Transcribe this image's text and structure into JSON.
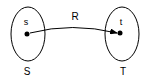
{
  "diagram": {
    "sets": [
      {
        "name": "S",
        "element": "s"
      },
      {
        "name": "T",
        "element": "t"
      }
    ],
    "relation": {
      "label": "R",
      "from": "s",
      "to": "t"
    },
    "colors": {
      "stroke": "#000000",
      "background": "#ffffff"
    }
  }
}
